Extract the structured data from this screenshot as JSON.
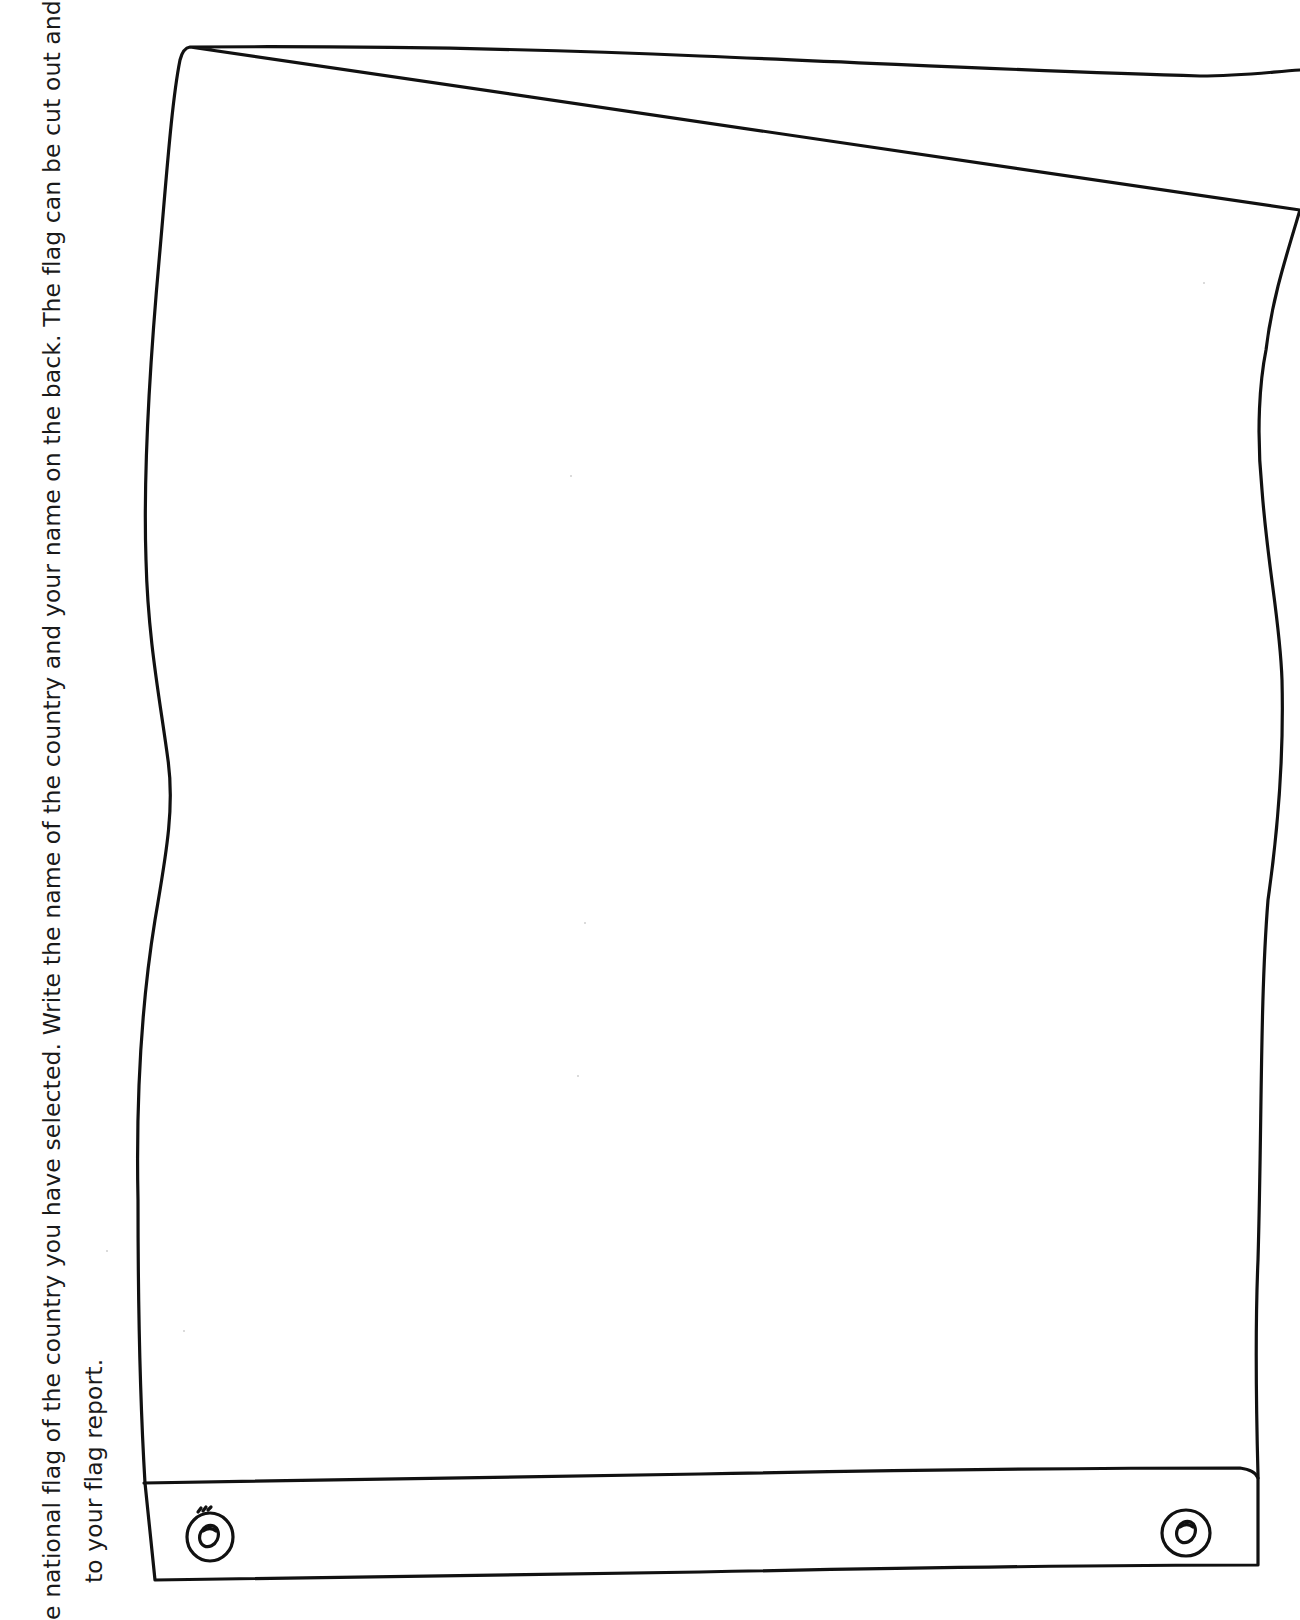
{
  "worksheet": {
    "instructions": {
      "line1": "e national flag of the country you have selected. Write the name of the country and your name on the back. The flag can be cut out and di",
      "line2": "to your flag report."
    },
    "flag": {
      "drawing_area_label": "Blank flag drawing area",
      "outline_color": "#111111",
      "background_color": "#ffffff",
      "hem": {
        "grommet_count": 2
      }
    }
  }
}
